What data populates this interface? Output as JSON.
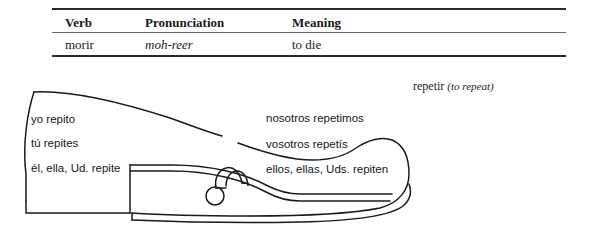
{
  "vocab_table": {
    "columns": [
      "Verb",
      "Pronunciation",
      "Meaning"
    ],
    "rows": [
      {
        "verb": "morir",
        "pronunciation": "moh-reer",
        "meaning": "to die"
      }
    ]
  },
  "verb_caption": {
    "infinitive": "repetir",
    "gloss": "(to repeat)"
  },
  "conjugation_diagram": {
    "shape": "shoe-outline",
    "description": "Boot/shoe verb diagram showing stem-changing forms inside the shoe",
    "left_column": [
      "yo repito",
      "tú repites",
      "él, ella, Ud. repite"
    ],
    "right_column": [
      "nosotros repetimos",
      "vosotros repetís",
      "ellos, ellas, Uds. repiten"
    ]
  },
  "colors": {
    "ink": "#1a1a1a",
    "rule_dark": "#2a2a2a",
    "rule_light": "#6b6b6b",
    "page_background": "#ffffff"
  }
}
